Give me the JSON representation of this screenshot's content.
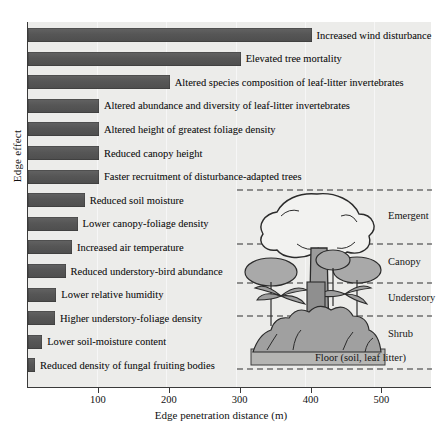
{
  "axes": {
    "ylabel": "Edge effect",
    "xlabel": "Edge penetration distance (m)",
    "xticks": [
      "100",
      "200",
      "300",
      "400",
      "500"
    ],
    "xtick_values": [
      100,
      200,
      300,
      400,
      500
    ]
  },
  "forest": {
    "strata": [
      {
        "name": "Emergent"
      },
      {
        "name": "Canopy"
      },
      {
        "name": "Understory"
      },
      {
        "name": "Shrub"
      },
      {
        "name": "Floor (soil, leaf litter)"
      }
    ]
  },
  "colors": {
    "bar": "#5b5b5b",
    "plot_background": "#ececea",
    "axis": "#3a3a3a",
    "text": "#141414",
    "canopy_fill": "#a9a9a9"
  },
  "chart_data": {
    "type": "bar",
    "orientation": "horizontal",
    "title": "",
    "xlabel": "Edge penetration distance (m)",
    "ylabel": "Edge effect",
    "xlim": [
      0,
      570
    ],
    "grid": false,
    "legend": "none",
    "categories": [
      "Increased wind disturbance",
      "Elevated tree mortality",
      "Altered species composition of leaf-litter invertebrates",
      "Altered abundance and diversity of leaf-litter invertebrates",
      "Altered height of greatest foliage density",
      "Reduced canopy height",
      "Faster recruitment of disturbance-adapted trees",
      "Reduced soil moisture",
      "Lower canopy-foliage density",
      "Increased air temperature",
      "Reduced understory-bird abundance",
      "Lower relative humidity",
      "Higher understory-foliage density",
      "Lower soil-moisture content",
      "Reduced density of fungal fruiting bodies"
    ],
    "values": [
      400,
      300,
      200,
      100,
      100,
      100,
      100,
      80,
      70,
      62,
      53,
      40,
      38,
      20,
      10
    ],
    "units": "m"
  }
}
